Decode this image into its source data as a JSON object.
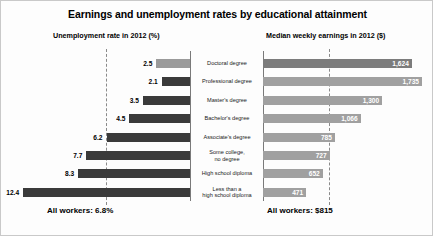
{
  "chart_data": {
    "type": "bar",
    "title": "Earnings and unemployment rates by educational attainment",
    "orientation": "horizontal-diverging",
    "categories": [
      "Doctoral degree",
      "Professional degree",
      "Master's degree",
      "Bachelor's degree",
      "Associate's degree",
      "Some college,\nno degree",
      "High school diploma",
      "Less than a\nhigh school diploma"
    ],
    "series": [
      {
        "name": "Unemployment rate in 2012 (%)",
        "side": "left",
        "unit": "%",
        "values": [
          2.5,
          2.1,
          3.5,
          4.5,
          6.2,
          7.7,
          8.3,
          12.4
        ],
        "labels": [
          "2.5",
          "2.1",
          "3.5",
          "4.5",
          "6.2",
          "7.7",
          "8.3",
          "12.4"
        ],
        "axis_max": 13.0,
        "average": 6.8,
        "average_label": "All workers: 6.8%"
      },
      {
        "name": "Median weekly earnings in 2012 ($)",
        "side": "right",
        "unit": "$",
        "values": [
          1624,
          1735,
          1300,
          1066,
          785,
          727,
          652,
          471
        ],
        "labels": [
          "1,624",
          "1,735",
          "1,300",
          "1,066",
          "785",
          "727",
          "652",
          "471"
        ],
        "axis_max": 1800,
        "average": 815,
        "average_label": "All workers: $815"
      }
    ],
    "grid": false,
    "legend": "none",
    "xlabel": "",
    "ylabel": ""
  },
  "headers": {
    "left": "Unemployment rate in 2012 (%)",
    "right": "Median weekly earnings in 2012 ($)"
  },
  "footers": {
    "left": "All workers: 6.8%",
    "right": "All workers: $815"
  },
  "colors": {
    "bar_left": "#3a3a3a",
    "bar_left_top": "#9a9a9a",
    "bar_right": "#a0a0a0",
    "bar_right_top": "#7c7c7c",
    "axis": "#7a7a7a",
    "refline": "#8a8a8a",
    "background": "#fdfdfd"
  }
}
